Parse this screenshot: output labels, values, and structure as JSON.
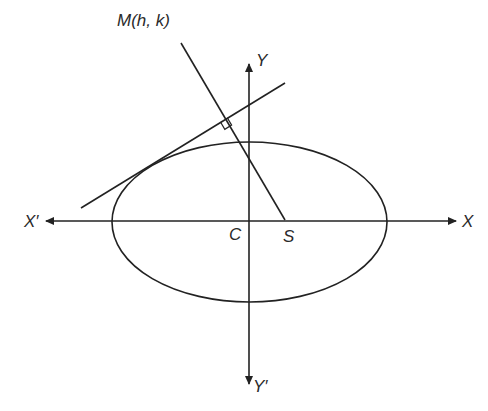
{
  "diagram": {
    "stroke_color": "#222222",
    "labels": {
      "point_m": "M(h, k)",
      "axis_y": "Y",
      "axis_y_neg": "Y′",
      "axis_x": "X",
      "axis_x_neg": "X′",
      "center": "C",
      "focus": "S"
    },
    "elements": {
      "ellipse": {
        "cx": 249.5,
        "cy": 222,
        "rx": 137.5,
        "ry": 80
      },
      "x_axis": {
        "x1": 50,
        "y1": 221,
        "x2": 455,
        "y2": 221
      },
      "y_axis": {
        "x1": 249,
        "y1": 68,
        "x2": 249,
        "y2": 380
      },
      "tangent_line": {
        "x1": 81,
        "y1": 208,
        "x2": 285,
        "y2": 83
      },
      "perpendicular_line": {
        "x1": 181,
        "y1": 43,
        "x2": 285,
        "y2": 220
      },
      "right_angle_foot": {
        "x": 227,
        "y": 118
      }
    }
  }
}
